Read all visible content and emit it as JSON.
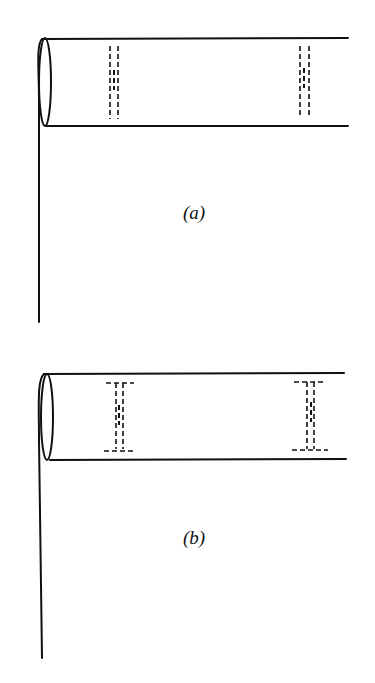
{
  "diagram": {
    "type": "cylinder-with-dashed-partitions",
    "colors": {
      "line": "#111111",
      "background": "#ffffff"
    },
    "panels": [
      {
        "id": "a",
        "label": "(a)",
        "description": "Horizontal tube with left-side elliptical opening, vertical stem, two dashed double-line partitions (no end flanges)",
        "partitions": [
          {
            "x": 113,
            "style": "dashed-double-line"
          },
          {
            "x": 306,
            "style": "dashed-double-line"
          }
        ]
      },
      {
        "id": "b",
        "label": "(b)",
        "description": "Same tube with two dashed I-beam shaped partitions (with end flanges at top and bottom)",
        "partitions": [
          {
            "x": 120,
            "style": "dashed-i-beam"
          },
          {
            "x": 312,
            "style": "dashed-i-beam"
          }
        ]
      }
    ]
  }
}
